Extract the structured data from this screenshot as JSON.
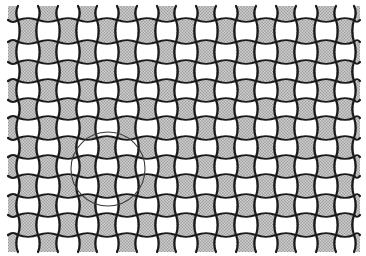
{
  "figure": {
    "title": "",
    "bounds": {
      "x0": 8,
      "y0": 6,
      "x1": 360,
      "y1": 252
    },
    "vertical_lines_x": [
      18,
      38,
      58,
      78,
      97,
      117,
      137,
      157,
      176,
      196,
      216,
      236,
      256,
      276,
      296,
      316,
      336,
      354
    ],
    "horizontal_lines_y": [
      20,
      42,
      62,
      81,
      100,
      118,
      138,
      157,
      176,
      196,
      215,
      235
    ],
    "first_cell_shaded": true,
    "colors": {
      "background": "#ffffff",
      "shaded_fill": "#c8c8c8",
      "shaded_dot": "#8a8a8a",
      "line": "#1a1a1a",
      "circle": "#3a3a3a"
    },
    "line_width": 2.2,
    "wave_amplitude": 2.2,
    "circle": {
      "cx": 108,
      "cy": 169,
      "r": 37,
      "stroke_width": 1.1
    }
  }
}
